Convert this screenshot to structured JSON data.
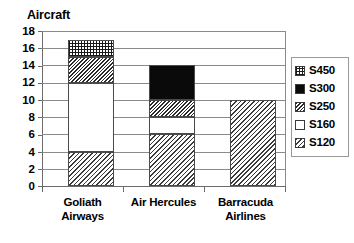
{
  "chart_data": {
    "type": "bar",
    "subtype": "stacked-column",
    "title": "Aircraft",
    "xlabel": "",
    "ylabel": "",
    "ylim": [
      0,
      18
    ],
    "ytick_step": 2,
    "yticks": [
      18,
      16,
      14,
      12,
      10,
      8,
      6,
      4,
      2,
      0
    ],
    "grid": true,
    "legend_position": "right",
    "categories": [
      "Goliath Airways",
      "Air Hercules",
      "Barracuda Airlines"
    ],
    "category_lines": [
      [
        "Goliath",
        "Airways"
      ],
      [
        "Air Hercules",
        ""
      ],
      [
        "Barracuda",
        "Airlines"
      ]
    ],
    "stack_order_bottom_to_top": [
      "S120",
      "S160",
      "S250",
      "S300",
      "S450"
    ],
    "series": [
      {
        "name": "S120",
        "pattern": "diagonal-hatch-light",
        "values": [
          4,
          6,
          10
        ]
      },
      {
        "name": "S160",
        "pattern": "solid-white",
        "values": [
          8,
          2,
          0
        ]
      },
      {
        "name": "S250",
        "pattern": "diagonal-hatch-dense",
        "values": [
          3,
          2,
          0
        ]
      },
      {
        "name": "S300",
        "pattern": "solid-black",
        "values": [
          0,
          4,
          0
        ]
      },
      {
        "name": "S450",
        "pattern": "grid-checker",
        "values": [
          2,
          0,
          0
        ]
      }
    ],
    "totals": [
      17,
      14,
      10
    ]
  },
  "legend": {
    "items": [
      {
        "label": "S450",
        "swatch": "grid-checker-swatch"
      },
      {
        "label": "S300",
        "swatch": "solid-black-swatch"
      },
      {
        "label": "S250",
        "swatch": "diagonal-dense-swatch"
      },
      {
        "label": "S160",
        "swatch": "solid-white-swatch"
      },
      {
        "label": "S120",
        "swatch": "diagonal-light-swatch"
      }
    ]
  },
  "colors": {
    "ink": "#000000",
    "gridline": "#8a8a8a",
    "axis": "#6b6b6b",
    "bar_outline": "#4a4a4a",
    "background": "#ffffff",
    "legend_border": "#9a9a9a"
  }
}
